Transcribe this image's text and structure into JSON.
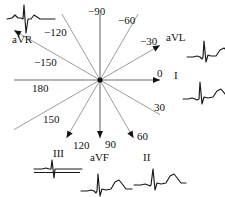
{
  "diagram": {
    "center": {
      "x": 100,
      "y": 80
    },
    "line_color": "#8a8a8a",
    "axis_color": "#6e6e6e",
    "text_color": "#111111",
    "trace_color": "#1a1a1a"
  },
  "degree_labels": [
    {
      "id": "deg-minus-90",
      "text": "−90",
      "x": 88,
      "y": 6,
      "angle": -90
    },
    {
      "id": "deg-minus-60",
      "text": "−60",
      "x": 118,
      "y": 15,
      "angle": -60
    },
    {
      "id": "deg-minus-120",
      "text": "−120",
      "x": 44,
      "y": 27,
      "angle": -120
    },
    {
      "id": "deg-minus-30",
      "text": "−30",
      "x": 140,
      "y": 36,
      "angle": -30
    },
    {
      "id": "deg-minus-150",
      "text": "−150",
      "x": 34,
      "y": 57,
      "angle": -150
    },
    {
      "id": "deg-0",
      "text": "0",
      "x": 157,
      "y": 68,
      "angle": 0
    },
    {
      "id": "deg-180",
      "text": "180",
      "x": 32,
      "y": 83,
      "angle": 180
    },
    {
      "id": "deg-30",
      "text": "30",
      "x": 154,
      "y": 102,
      "angle": 30
    },
    {
      "id": "deg-150",
      "text": "150",
      "x": 43,
      "y": 114,
      "angle": 150
    },
    {
      "id": "deg-60",
      "text": "60",
      "x": 137,
      "y": 131,
      "angle": 60
    },
    {
      "id": "deg-120",
      "text": "120",
      "x": 73,
      "y": 140,
      "angle": 120
    },
    {
      "id": "deg-90",
      "text": "90",
      "x": 105,
      "y": 139,
      "angle": 90
    }
  ],
  "leads": [
    {
      "id": "lead-aVR",
      "label": "aVR",
      "label_x": 12,
      "label_y": 34,
      "trace_x": 6,
      "trace_y": 2,
      "angle": -150
    },
    {
      "id": "lead-aVL",
      "label": "aVL",
      "label_x": 166,
      "label_y": 32,
      "trace_x": 186,
      "trace_y": 34,
      "angle": -30
    },
    {
      "id": "lead-I",
      "label": "I",
      "label_x": 174,
      "label_y": 70,
      "trace_x": 182,
      "trace_y": 76,
      "angle": 0
    },
    {
      "id": "lead-II",
      "label": "II",
      "label_x": 143,
      "label_y": 152,
      "trace_x": 133,
      "trace_y": 162,
      "angle": 60
    },
    {
      "id": "lead-aVF",
      "label": "aVF",
      "label_x": 90,
      "label_y": 152,
      "trace_x": 80,
      "trace_y": 168,
      "angle": 90
    },
    {
      "id": "lead-III",
      "label": "III",
      "label_x": 53,
      "label_y": 148,
      "trace_x": 33,
      "trace_y": 155,
      "angle": 120
    }
  ],
  "axes": [
    {
      "id": "axis-0-180",
      "angle_pos": 0,
      "angle_neg": 180,
      "arrow_pos": true,
      "arrow_neg": false
    },
    {
      "id": "axis-30-150",
      "angle_pos": 30,
      "angle_neg": -150,
      "arrow_pos": false,
      "arrow_neg": true
    },
    {
      "id": "axis-60-120",
      "angle_pos": 60,
      "angle_neg": -120,
      "arrow_pos": true,
      "arrow_neg": false
    },
    {
      "id": "axis-90-270",
      "angle_pos": 90,
      "angle_neg": -90,
      "arrow_pos": true,
      "arrow_neg": false
    },
    {
      "id": "axis-120-300",
      "angle_pos": 120,
      "angle_neg": -60,
      "arrow_pos": true,
      "arrow_neg": false
    },
    {
      "id": "axis-150-330",
      "angle_pos": 150,
      "angle_neg": -30,
      "arrow_pos": false,
      "arrow_neg": true
    }
  ],
  "waveforms": {
    "aVR": {
      "description": "small positive deflection, deep negative QS, small positive, flat",
      "points": "0,16 5,15 8,12 11,15 14,15 16,16 17,2 19,30 21,16 24,16 27,12 30,14 33,16 40,16 48,16"
    },
    "aVL": {
      "description": "small dip then tall R spike then rounded T wave",
      "points": "0,22 6,22 10,21 13,22 15,24 16,22 17,6 19,27 21,20 24,21 29,21 33,15 37,13 41,17 44,20 50,20"
    },
    "I": {
      "description": "small P wave, tall R spike, rounded T wave",
      "points": "0,22 5,22 9,21 12,22 14,23 16,22 17,5 19,27 21,20 25,21 30,20 34,14 38,12 42,17 45,20 50,20"
    },
    "II": {
      "description": "flat baseline, small P, tall R spike, rounded T wave",
      "points": "0,22 7,22 11,21 14,22 16,23 17,22 19,6 21,27 23,20 27,21 32,20 36,13 40,11 44,16 47,20 52,20"
    },
    "aVF": {
      "description": "small P, tall R spike, rounded T wave",
      "points": "0,22 6,22 10,21 13,22 15,24 16,22 17,5 19,27 21,20 25,21 30,20 34,13 38,11 42,16 45,20 51,20"
    },
    "III": {
      "description": "nearly isoelectric small biphasic up-down spike",
      "points": "0,13 8,13 12,12 15,13 17,13 18,4 20,22 21,13 25,13 33,13 42,13 48,13"
    }
  }
}
